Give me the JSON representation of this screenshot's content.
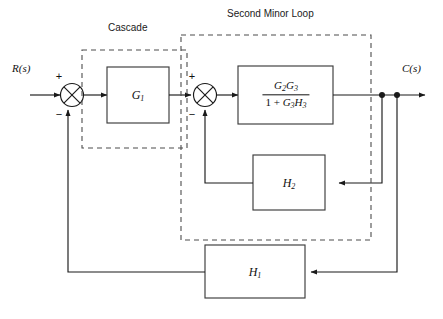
{
  "diagram": {
    "title_groups": [
      {
        "name": "cascade",
        "label": "Cascade"
      },
      {
        "name": "second-minor-loop",
        "label": "Second Minor Loop"
      }
    ],
    "signals": {
      "input_label": "R(s)",
      "output_label": "C(s)"
    },
    "blocks": [
      {
        "name": "g1",
        "label": "G",
        "sub": "1"
      },
      {
        "name": "h2",
        "label": "H",
        "sub": "2"
      },
      {
        "name": "h1",
        "label": "H",
        "sub": "1"
      }
    ],
    "transfer_block": {
      "name": "inner-loop-transfer",
      "numerator": {
        "t1": "G",
        "s1": "2",
        "t2": "G",
        "s2": "3"
      },
      "denominator": {
        "one": "1",
        "op": " + ",
        "t1": "G",
        "s1": "3",
        "t2": "H",
        "s2": "3"
      },
      "plain": "G2G3 / (1 + G3H3)"
    },
    "summing_junctions": [
      {
        "name": "summing-junction-1",
        "plus": "+",
        "minus": "−"
      },
      {
        "name": "summing-junction-2",
        "plus": "+",
        "minus": "−"
      }
    ],
    "colors": {
      "line": "#1a1a1a",
      "dashed": "#4d4d4d",
      "block_border": "#3c3c3c",
      "background": "#ffffff",
      "text": "#111111"
    }
  }
}
